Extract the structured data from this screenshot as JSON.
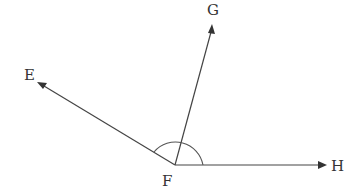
{
  "diagram": {
    "type": "angle-rays",
    "vertex": {
      "label": "F",
      "x": 175,
      "y": 165
    },
    "rays": [
      {
        "label": "E",
        "end": {
          "x": 39,
          "y": 83
        }
      },
      {
        "label": "G",
        "end": {
          "x": 212,
          "y": 26
        }
      },
      {
        "label": "H",
        "end": {
          "x": 326,
          "y": 165
        }
      }
    ],
    "angle_marker": {
      "type": "arc",
      "from_ray": "H",
      "to_ray": "E",
      "radius": 28
    },
    "colors": {
      "line": "#444444",
      "text": "#333333",
      "background": "#ffffff"
    }
  },
  "labels": {
    "E": "E",
    "F": "F",
    "G": "G",
    "H": "H"
  }
}
